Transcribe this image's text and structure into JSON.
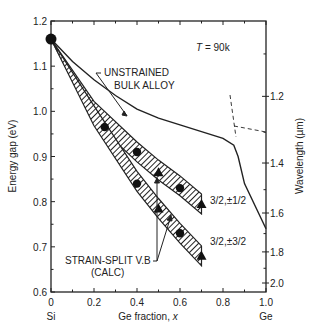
{
  "chart_data": {
    "type": "line",
    "title": "",
    "annotation_temperature": "T = 90k",
    "xlabel": "Ge fraction, x",
    "ylabel": "Energy gap (eV)",
    "y2label": "Wavelength (µm)",
    "xlim": [
      0,
      1.0
    ],
    "ylim": [
      0.6,
      1.2
    ],
    "x_ticks": [
      "0",
      "0.2",
      "0.4",
      "0.6",
      "0.8",
      "1.0"
    ],
    "x_end_labels": {
      "left": "Si",
      "right": "Ge"
    },
    "y_ticks": [
      "0.6",
      "0.7",
      "0.8",
      "0.9",
      "1.0",
      "1.1",
      "1.2"
    ],
    "y2_ticks": [
      "1.2",
      "1.4",
      "1.6",
      "1.8",
      "2.0"
    ],
    "grid": false,
    "series": [
      {
        "name": "UNSTRAINED BULK ALLOY",
        "style": "solid-line",
        "x": [
          0,
          0.1,
          0.2,
          0.3,
          0.4,
          0.5,
          0.6,
          0.7,
          0.8,
          0.85,
          0.87,
          0.9,
          1.0
        ],
        "y": [
          1.16,
          1.11,
          1.07,
          1.035,
          1.005,
          0.985,
          0.97,
          0.955,
          0.94,
          0.925,
          0.9,
          0.84,
          0.74
        ]
      },
      {
        "name": "3/2,±1/2",
        "style": "hatched-band (calc)",
        "x": [
          0,
          0.2,
          0.4,
          0.5,
          0.6,
          0.7
        ],
        "y": [
          1.16,
          1.0,
          0.91,
          0.87,
          0.835,
          0.795
        ],
        "points": [
          {
            "x": 0,
            "y": 1.16,
            "marker": "circle"
          },
          {
            "x": 0.4,
            "y": 0.91,
            "marker": "circle"
          },
          {
            "x": 0.5,
            "y": 0.865,
            "marker": "triangle"
          },
          {
            "x": 0.6,
            "y": 0.83,
            "marker": "circle"
          },
          {
            "x": 0.7,
            "y": 0.795,
            "marker": "triangle"
          }
        ]
      },
      {
        "name": "3/2,±3/2",
        "style": "hatched-band (calc)",
        "x": [
          0,
          0.2,
          0.4,
          0.5,
          0.6,
          0.7
        ],
        "y": [
          1.16,
          0.99,
          0.845,
          0.785,
          0.73,
          0.68
        ],
        "points": [
          {
            "x": 0.25,
            "y": 0.965,
            "marker": "circle"
          },
          {
            "x": 0.4,
            "y": 0.84,
            "marker": "circle"
          },
          {
            "x": 0.5,
            "y": 0.785,
            "marker": "triangle"
          },
          {
            "x": 0.6,
            "y": 0.73,
            "marker": "circle"
          },
          {
            "x": 0.7,
            "y": 0.68,
            "marker": "triangle"
          }
        ]
      }
    ],
    "annotations": [
      {
        "text": "UNSTRAINED",
        "line2": "BULK ALLOY"
      },
      {
        "text": "STRAIN-SPLIT V.B",
        "line2": "(CALC)"
      },
      {
        "text": "3/2,±1/2"
      },
      {
        "text": "3/2,±3/2"
      }
    ]
  },
  "labels": {
    "temp": "T = 90k",
    "unstrained1": "UNSTRAINED",
    "unstrained2": "BULK ALLOY",
    "strain1": "STRAIN-SPLIT V.B",
    "strain2": "(CALC)",
    "band_half": "3/2,±1/2",
    "band_threehalf": "3/2,±3/2",
    "xlabel": "Ge fraction, ",
    "xlabel_var": "x",
    "ylabel": "Energy gap (eV)",
    "y2label": "Wavelength (µm)",
    "si": "Si",
    "ge": "Ge"
  }
}
